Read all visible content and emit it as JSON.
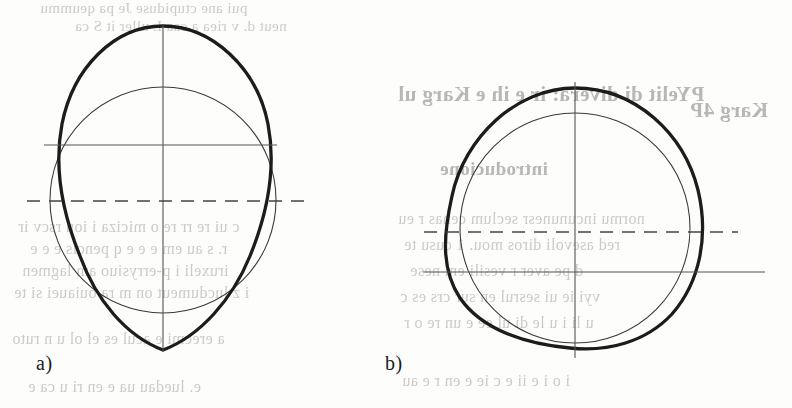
{
  "page": {
    "kind": "scanned-book-figure-page",
    "width": 792,
    "height": 408,
    "background_color": "#fdfdfc",
    "ink_color": "#1c1c1c",
    "thin_line_color": "#3a3a3a",
    "ghost_text_color": "#b9b7b4"
  },
  "figures": [
    {
      "id": "figure-a",
      "caption": "a)",
      "caption_position": {
        "x": 36,
        "y": 352
      },
      "center": {
        "x": 163,
        "y": 200
      },
      "reference_circle": {
        "name": "thin-reference-circle",
        "cx": 163,
        "cy": 200,
        "r": 113,
        "stroke_width": 1.1,
        "stroke": "#3a3a3a",
        "style": "solid-thin"
      },
      "profile_curve": {
        "name": "thick-ovoid-profile",
        "description": "egg shaped closed curve, broad rounded top, narrowing to a rounded point at the bottom, widest above the horizontal centre line",
        "stroke_width": 3.2,
        "stroke": "#1c1c1c",
        "style": "solid-thick",
        "top_y": 26,
        "bottom_y": 350,
        "left_x": 56,
        "right_x": 272,
        "widest_y": 150
      },
      "axes": [
        {
          "name": "vertical-centre-axis",
          "orientation": "vertical",
          "style": "solid-thin",
          "x": 163,
          "y1": 24,
          "y2": 352
        },
        {
          "name": "horizontal-major-axis",
          "orientation": "horizontal",
          "style": "solid-thin",
          "y": 145,
          "x1": 44,
          "x2": 277
        },
        {
          "name": "horizontal-dashed-axis",
          "orientation": "horizontal",
          "style": "dashed",
          "y": 201,
          "x1": 27,
          "x2": 308
        }
      ]
    },
    {
      "id": "figure-b",
      "caption": "b)",
      "caption_position": {
        "x": 385,
        "y": 352
      },
      "center": {
        "x": 575,
        "y": 225
      },
      "reference_circle": {
        "name": "thin-reference-circle",
        "cx": 575,
        "cy": 228,
        "r": 115,
        "stroke_width": 1.1,
        "stroke": "#3a3a3a",
        "style": "solid-thin"
      },
      "profile_curve": {
        "name": "thick-rounded-triangle-profile",
        "description": "closed rounded triangular (Reuleaux-like) curve, bulging to the upper left and to the right, flatter across the bottom, drawn slightly above and right of the reference circle",
        "stroke_width": 3.2,
        "stroke": "#1c1c1c",
        "style": "solid-thick",
        "top_y": 88,
        "bottom_y": 348,
        "left_x": 450,
        "right_x": 702
      },
      "axes": [
        {
          "name": "vertical-centre-axis",
          "orientation": "vertical",
          "style": "solid-thin",
          "x": 575,
          "y1": 82,
          "y2": 358
        },
        {
          "name": "horizontal-dashed-axis",
          "orientation": "horizontal",
          "style": "dashed",
          "y": 232,
          "x1": 424,
          "x2": 738
        },
        {
          "name": "horizontal-major-axis",
          "orientation": "horizontal",
          "style": "solid-thin",
          "y": 272,
          "x1": 423,
          "x2": 765
        }
      ]
    }
  ],
  "ghost_text": {
    "note": "faint mirrored show-through of printing on the reverse side of the sheet",
    "lines": [
      {
        "text": "pui ane ctupiduse Je pa qeummu",
        "x": 40,
        "y": 0,
        "size": 15,
        "head": false
      },
      {
        "text": "neut d. v riea a caa L uller it S ca",
        "x": 75,
        "y": 18,
        "size": 15,
        "head": false
      },
      {
        "text": "PYelit di divera: ir e ih e Karg ul",
        "x": 398,
        "y": 82,
        "size": 21,
        "head": true
      },
      {
        "text": "Karg  4P",
        "x": 690,
        "y": 98,
        "size": 21,
        "head": true
      },
      {
        "text": "introducione",
        "x": 440,
        "y": 158,
        "size": 19,
        "head": true
      },
      {
        "text": "c ui re rr re o miciza i ion rscv ir",
        "x": 18,
        "y": 218,
        "size": 16,
        "head": false
      },
      {
        "text": "normu incununesr seclum cenas r eu",
        "x": 398,
        "y": 210,
        "size": 16,
        "head": false
      },
      {
        "text": "r. s au em e e  e  q  pencis e e  e",
        "x": 30,
        "y": 240,
        "size": 16,
        "head": false
      },
      {
        "text": "red asevoli diros mou. 1 cusu te",
        "x": 404,
        "y": 236,
        "size": 16,
        "head": false
      },
      {
        "text": "iruxeli  i  p-errysiuo am lagmen",
        "x": 22,
        "y": 262,
        "size": 16,
        "head": false
      },
      {
        "text": "d  pe aver  r  vesili  em  nese",
        "x": 410,
        "y": 262,
        "size": 16,
        "head": false
      },
      {
        "text": "i z lucdumeut on m  ra ouiauei si te",
        "x": 14,
        "y": 284,
        "size": 16,
        "head": false
      },
      {
        "text": "vyi ie ui sesrul en sur crs es c",
        "x": 400,
        "y": 288,
        "size": 16,
        "head": false
      },
      {
        "text": "a erecmi e acul es el ol u  n ruto",
        "x": 12,
        "y": 330,
        "size": 16,
        "head": false
      },
      {
        "text": "u  li  i u le di ul ee e un re o r",
        "x": 404,
        "y": 314,
        "size": 16,
        "head": false
      },
      {
        "text": "e. luedau   ua  e en ri u  ca e",
        "x": 28,
        "y": 378,
        "size": 16,
        "head": false
      },
      {
        "text": "i o i e ii e c ie e  en r e  au",
        "x": 402,
        "y": 372,
        "size": 16,
        "head": false
      }
    ]
  }
}
